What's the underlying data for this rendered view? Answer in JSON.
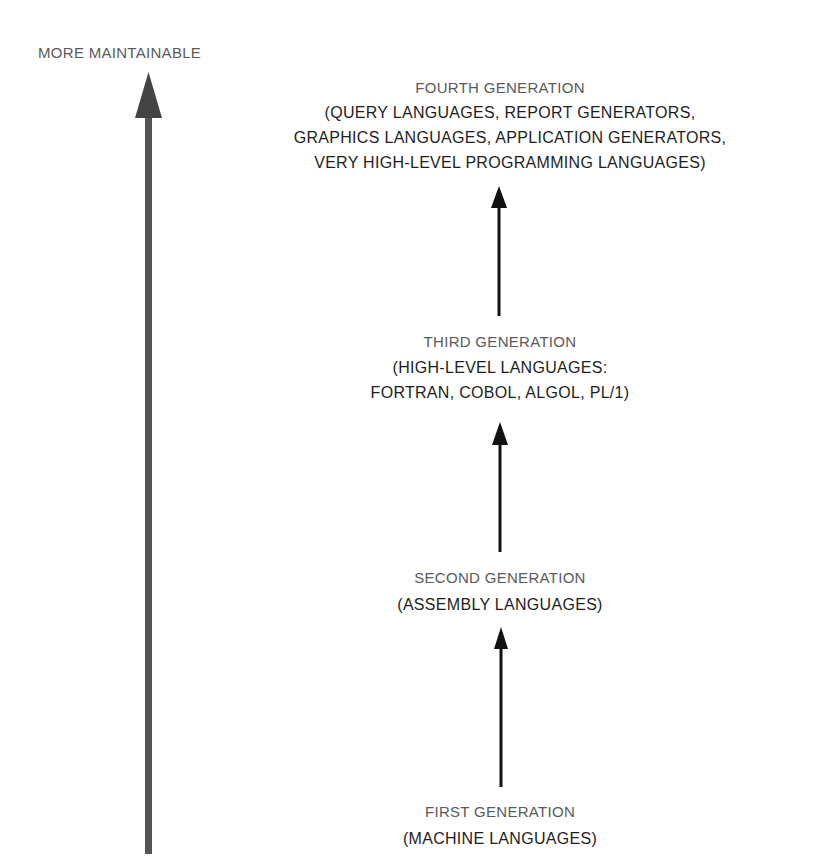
{
  "axis": {
    "label": "MORE MAINTAINABLE",
    "color": "#555555"
  },
  "generations": [
    {
      "title": "FOURTH GENERATION",
      "lines": [
        "(QUERY LANGUAGES, REPORT GENERATORS,",
        "GRAPHICS LANGUAGES, APPLICATION GENERATORS,",
        "VERY HIGH-LEVEL PROGRAMMING LANGUAGES)"
      ]
    },
    {
      "title": "THIRD GENERATION",
      "lines": [
        "(HIGH-LEVEL LANGUAGES:",
        "FORTRAN, COBOL, ALGOL, PL/1)"
      ]
    },
    {
      "title": "SECOND GENERATION",
      "lines": [
        "(ASSEMBLY LANGUAGES)"
      ]
    },
    {
      "title": "FIRST GENERATION",
      "lines": [
        "(MACHINE LANGUAGES)"
      ]
    }
  ]
}
